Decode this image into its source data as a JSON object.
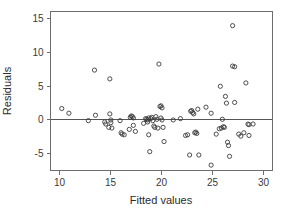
{
  "chart_data": {
    "type": "scatter",
    "title": "",
    "xlabel": "Fitted values",
    "ylabel": "Residuals",
    "xlim": [
      9.2,
      30.9
    ],
    "ylim": [
      -7.6,
      16.0
    ],
    "xticks": [
      10,
      15,
      20,
      25,
      30
    ],
    "xtick_labels": [
      "10",
      "15",
      "20",
      "25",
      "30"
    ],
    "yticks": [
      -5,
      0,
      5,
      10,
      15
    ],
    "ytick_labels": [
      "-5",
      "0",
      "5",
      "10",
      "15"
    ],
    "grid": false,
    "legend": null,
    "reference_lines": [
      {
        "name": "zero-residual-line",
        "orientation": "horizontal",
        "y": 0
      }
    ],
    "marker": {
      "shape": "open-circle",
      "radius_px": 2.1,
      "stroke": "#3b3b3b",
      "fill": "none"
    },
    "n_points": 88,
    "points": [
      [
        10.3,
        1.6
      ],
      [
        11.0,
        0.9
      ],
      [
        13.5,
        7.3
      ],
      [
        13.6,
        0.6
      ],
      [
        14.5,
        -0.4
      ],
      [
        14.6,
        -0.7
      ],
      [
        14.9,
        -1.2
      ],
      [
        15.0,
        6.0
      ],
      [
        15.0,
        0.8
      ],
      [
        15.1,
        -0.1
      ],
      [
        15.1,
        -0.5
      ],
      [
        15.2,
        -1.3
      ],
      [
        16.0,
        -0.2
      ],
      [
        16.1,
        -2.0
      ],
      [
        16.2,
        -2.2
      ],
      [
        16.4,
        -2.3
      ],
      [
        16.9,
        -1.5
      ],
      [
        17.0,
        0.3
      ],
      [
        17.1,
        0.5
      ],
      [
        17.2,
        0.4
      ],
      [
        17.3,
        0.2
      ],
      [
        17.3,
        -0.9
      ],
      [
        17.5,
        -1.8
      ],
      [
        18.3,
        -0.6
      ],
      [
        18.5,
        0.1
      ],
      [
        18.6,
        0.0
      ],
      [
        18.7,
        -0.1
      ],
      [
        18.7,
        -0.4
      ],
      [
        18.8,
        0.2
      ],
      [
        18.8,
        -2.3
      ],
      [
        18.9,
        -4.8
      ],
      [
        19.0,
        0.1
      ],
      [
        19.1,
        0.3
      ],
      [
        19.2,
        -0.2
      ],
      [
        19.3,
        -1.0
      ],
      [
        19.4,
        -1.2
      ],
      [
        19.5,
        0.4
      ],
      [
        19.6,
        0.0
      ],
      [
        19.7,
        -1.3
      ],
      [
        19.8,
        8.2
      ],
      [
        19.9,
        1.9
      ],
      [
        20.0,
        2.0
      ],
      [
        20.0,
        0.2
      ],
      [
        20.1,
        1.7
      ],
      [
        20.1,
        -0.1
      ],
      [
        20.2,
        -1.2
      ],
      [
        20.3,
        -3.3
      ],
      [
        21.9,
        0.1
      ],
      [
        22.4,
        -2.4
      ],
      [
        22.6,
        -2.3
      ],
      [
        22.8,
        -5.3
      ],
      [
        22.9,
        1.2
      ],
      [
        23.0,
        1.3
      ],
      [
        23.1,
        1.0
      ],
      [
        23.2,
        0.8
      ],
      [
        23.3,
        -2.0
      ],
      [
        23.4,
        -1.9
      ],
      [
        23.5,
        -2.1
      ],
      [
        23.6,
        1.5
      ],
      [
        23.7,
        -5.3
      ],
      [
        24.4,
        1.8
      ],
      [
        24.9,
        -6.8
      ],
      [
        25.4,
        -2.2
      ],
      [
        25.7,
        -1.4
      ],
      [
        25.8,
        4.9
      ],
      [
        25.9,
        -1.3
      ],
      [
        26.0,
        0.0
      ],
      [
        26.1,
        -1.1
      ],
      [
        26.2,
        -1.2
      ],
      [
        26.3,
        3.4
      ],
      [
        26.4,
        2.4
      ],
      [
        26.5,
        -3.4
      ],
      [
        26.6,
        -3.9
      ],
      [
        26.7,
        -5.5
      ],
      [
        27.0,
        13.9
      ],
      [
        27.0,
        7.9
      ],
      [
        27.2,
        7.8
      ],
      [
        27.2,
        2.5
      ],
      [
        27.6,
        -2.2
      ],
      [
        27.8,
        -2.5
      ],
      [
        28.3,
        5.4
      ],
      [
        28.5,
        -0.7
      ],
      [
        28.6,
        -0.8
      ],
      [
        28.6,
        -2.4
      ],
      [
        28.1,
        -2.0
      ],
      [
        24.9,
        0.9
      ],
      [
        21.2,
        -0.1
      ],
      [
        12.9,
        -0.2
      ],
      [
        29.0,
        -0.7
      ]
    ]
  },
  "axes": {
    "x_title": "Fitted values",
    "y_title": "Residuals"
  },
  "colors": {
    "marker_stroke": "#3b3b3b",
    "frame": "#6d6d6d",
    "zero_line": "#555555",
    "text": "#2b2b2b",
    "background": "#ffffff"
  }
}
